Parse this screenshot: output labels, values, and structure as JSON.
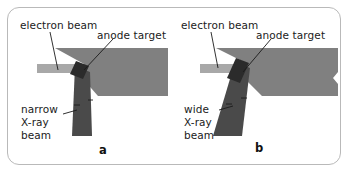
{
  "figure": {
    "background_color": "#ffffff",
    "frame_color": "#b9b9b9",
    "colors": {
      "electron_beam": "#a8a8a8",
      "anode_body": "#808080",
      "anode_target": "#2b2b2b",
      "xray_beam": "#4a4a4a",
      "leader_line": "#1b1b1b",
      "text": "#1b1b1b"
    }
  },
  "panels": [
    {
      "letter": "a",
      "labels": {
        "electron_beam": "electron beam",
        "anode_target": "anode target",
        "xray_beam_line1": "narrow",
        "xray_beam_line2": "X-ray",
        "xray_beam_line3": "beam"
      }
    },
    {
      "letter": "b",
      "labels": {
        "electron_beam": "electron beam",
        "anode_target": "anode target",
        "xray_beam_line1": "wide",
        "xray_beam_line2": "X-ray",
        "xray_beam_line3": "beam"
      }
    }
  ]
}
